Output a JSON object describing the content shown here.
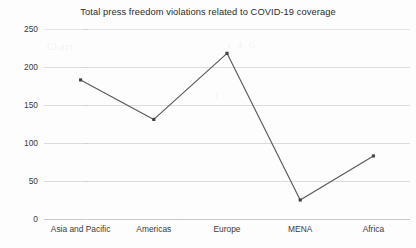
{
  "chart_data": {
    "type": "line",
    "title": "Total press freedom violations related to COVID-19 coverage",
    "xlabel": "",
    "ylabel": "",
    "categories": [
      "Asia and Pacific",
      "Americas",
      "Europe",
      "MENA",
      "Africa"
    ],
    "values": [
      183,
      131,
      218,
      25,
      83
    ],
    "series": [
      {
        "name": "Total press freedom violations",
        "values": [
          183,
          131,
          218,
          25,
          83
        ]
      }
    ],
    "ylim": [
      0,
      250
    ],
    "yticks": [
      0,
      50,
      100,
      150,
      200,
      250
    ],
    "ytick_labels": [
      "0",
      "50",
      "100",
      "150",
      "200",
      "250"
    ],
    "grid": true,
    "legend": false,
    "legend_position": "none",
    "line_color": "#595959",
    "marker": "square",
    "marker_color": "#404040",
    "grid_color": "#dcdcdc",
    "background_color": "#fdfdfd",
    "text_color": "#2b2b2b"
  },
  "artifacts": {
    "bleed_1": "Chart",
    "bleed_2": "x 4 G",
    "bleed_3": "J"
  }
}
